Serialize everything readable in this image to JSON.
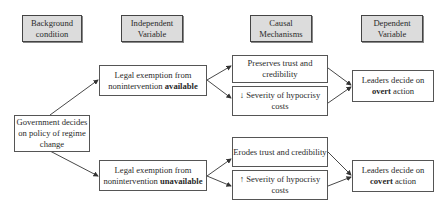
{
  "headers": {
    "background": "Background condition",
    "independent": "Independent Variable",
    "causal": "Causal Mechanisms",
    "dependent": "Dependent Variable"
  },
  "background_box": {
    "text": "Government decides on policy of regime change"
  },
  "top_branch": {
    "independent_prefix": "Legal exemption from nonintervention ",
    "independent_bold": "available",
    "mechanism_1": "Preserves trust and credibility",
    "mechanism_2": "↓ Severity of hypocrisy costs",
    "outcome_prefix": "Leaders decide on ",
    "outcome_bold": "overt",
    "outcome_suffix": " action"
  },
  "bottom_branch": {
    "independent_prefix": "Legal exemption from nonintervention ",
    "independent_bold": "unavailable",
    "mechanism_1": "Erodes trust and credibility",
    "mechanism_2": "↑ Severity of hypocrisy costs",
    "outcome_prefix": "Leaders decide on ",
    "outcome_bold": "covert",
    "outcome_suffix": " action"
  },
  "colors": {
    "header_fill": "#dcdcdc",
    "border": "#555555",
    "arrow": "#333333"
  }
}
